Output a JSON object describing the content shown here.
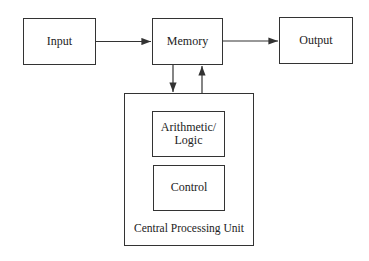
{
  "diagram": {
    "nodes": {
      "input": {
        "label": "Input"
      },
      "memory": {
        "label": "Memory"
      },
      "output": {
        "label": "Output"
      },
      "cpu": {
        "label": "Central Processing Unit"
      },
      "alu": {
        "label_line1": "Arithmetic/",
        "label_line2": "Logic"
      },
      "control": {
        "label": "Control"
      }
    },
    "edges": [
      {
        "from": "Input",
        "to": "Memory"
      },
      {
        "from": "Memory",
        "to": "Output"
      },
      {
        "from": "Memory",
        "to": "Central Processing Unit"
      },
      {
        "from": "Central Processing Unit",
        "to": "Memory"
      }
    ],
    "colors": {
      "line": "#333333",
      "background": "#ffffff"
    }
  }
}
